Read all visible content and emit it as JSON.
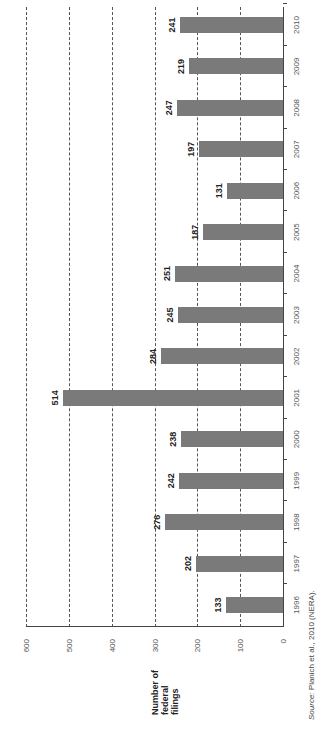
{
  "chart_data": {
    "type": "bar",
    "orientation": "rotated 90° counter-clockwise (vertical bars drawn on page rotated)",
    "title": "",
    "xlabel": "",
    "ylabel": "Number of federal filings",
    "categories": [
      "1996",
      "1997",
      "1998",
      "1999",
      "2000",
      "2001",
      "2002",
      "2003",
      "2004",
      "2005",
      "2006",
      "2007",
      "2008",
      "2009",
      "2010"
    ],
    "values": [
      133,
      202,
      276,
      242,
      238,
      514,
      284,
      245,
      251,
      187,
      131,
      197,
      247,
      219,
      241
    ],
    "ylim": [
      0,
      600
    ],
    "yticks": [
      0,
      100,
      200,
      300,
      400,
      500,
      600
    ],
    "grid": true,
    "grid_style": "dashed horizontal lines at 100-unit intervals",
    "bar_color": "#7a7a7a",
    "data_labels": true,
    "source": "Source: Planich et al., 2010 (NERA)."
  },
  "axis": {
    "ylabel_lines": [
      "Number of",
      "federal",
      "filings"
    ],
    "yticks": [
      "0",
      "100",
      "200",
      "300",
      "400",
      "500",
      "600"
    ]
  },
  "source": {
    "label": "Source:",
    "text": " Planich et al., 2010 (NERA)."
  }
}
